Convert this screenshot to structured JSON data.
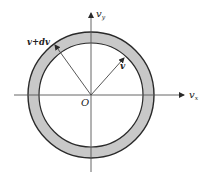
{
  "diagram": {
    "type": "velocity-space spherical shell",
    "labels": {
      "vy_axis": "v",
      "vy_sub": "y",
      "vx_axis": "v",
      "vx_sub": "x",
      "origin": "O",
      "inner_vector": "v",
      "outer_vector": "v+dv"
    },
    "colors": {
      "shell_fill": "#c8c8c8",
      "stroke": "#2a2a2a",
      "axis": "#555555",
      "background": "#ffffff"
    },
    "geometry": {
      "origin": [
        91,
        95
      ],
      "outer_radius": 63,
      "inner_radius": 52
    }
  }
}
